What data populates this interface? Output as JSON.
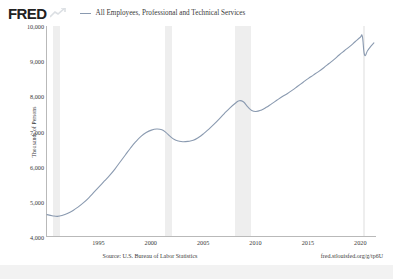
{
  "brand": {
    "logo_text": "FRED",
    "logo_mark_icon": "fred-trend-arrow-icon"
  },
  "legend": {
    "swatch_icon": "line-swatch-icon",
    "label": "All Employees, Professional and Technical Services"
  },
  "footer": {
    "source": "Source: U.S. Bureau of Labor Statistics",
    "permalink": "fred.stlouisfed.org/g/tp6U"
  },
  "colors": {
    "series_line": "#8a9ab0",
    "recession_band": "#eeeeee",
    "axis": "#b9b9b9",
    "text": "#3a3a3a",
    "background": "#ffffff"
  },
  "chart_data": {
    "type": "line",
    "title": "All Employees, Professional and Technical Services",
    "xlabel": "",
    "ylabel": "Thousands of Persons",
    "xlim": [
      1990,
      2021.5
    ],
    "ylim": [
      4000,
      10000
    ],
    "ytick_labels": [
      "10,000",
      "9,000",
      "8,000",
      "7,000",
      "6,000",
      "5,000",
      "4,000"
    ],
    "ytick_values": [
      10000,
      9000,
      8000,
      7000,
      6000,
      5000,
      4000
    ],
    "xtick_labels": [
      "1995",
      "2000",
      "2005",
      "2010",
      "2015",
      "2020"
    ],
    "xtick_values": [
      1995,
      2000,
      2005,
      2010,
      2015,
      2020
    ],
    "grid": false,
    "legend_position": "top",
    "units": "Thousands of Persons",
    "frequency": "Monthly, Seasonally Adjusted",
    "recession_bands": [
      {
        "start": 1990.58,
        "end": 1991.25
      },
      {
        "start": 2001.25,
        "end": 2001.92
      },
      {
        "start": 2007.96,
        "end": 2009.5
      },
      {
        "start": 2020.17,
        "end": 2020.33
      }
    ],
    "series": [
      {
        "name": "All Employees, Professional and Technical Services",
        "color": "#8a9ab0",
        "x": [
          1990.0,
          1990.5,
          1991.0,
          1991.5,
          1992.0,
          1992.5,
          1993.0,
          1993.5,
          1994.0,
          1994.5,
          1995.0,
          1995.5,
          1996.0,
          1996.5,
          1997.0,
          1997.5,
          1998.0,
          1998.5,
          1999.0,
          1999.5,
          2000.0,
          2000.5,
          2001.0,
          2001.4,
          2001.8,
          2002.2,
          2002.6,
          2003.0,
          2003.5,
          2004.0,
          2004.5,
          2005.0,
          2005.5,
          2006.0,
          2006.5,
          2007.0,
          2007.5,
          2008.0,
          2008.4,
          2008.8,
          2009.2,
          2009.6,
          2010.0,
          2010.5,
          2011.0,
          2011.5,
          2012.0,
          2012.5,
          2013.0,
          2013.5,
          2014.0,
          2014.5,
          2015.0,
          2015.5,
          2016.0,
          2016.5,
          2017.0,
          2017.5,
          2018.0,
          2018.5,
          2019.0,
          2019.5,
          2020.0,
          2020.2,
          2020.4,
          2020.7,
          2021.0,
          2021.3
        ],
        "y": [
          4620,
          4590,
          4570,
          4600,
          4660,
          4740,
          4840,
          4960,
          5100,
          5260,
          5420,
          5580,
          5740,
          5920,
          6120,
          6320,
          6520,
          6700,
          6850,
          6960,
          7030,
          7060,
          7040,
          6960,
          6850,
          6760,
          6720,
          6700,
          6710,
          6740,
          6820,
          6930,
          7060,
          7200,
          7350,
          7510,
          7660,
          7790,
          7870,
          7840,
          7700,
          7590,
          7560,
          7600,
          7680,
          7780,
          7880,
          7980,
          8070,
          8170,
          8280,
          8390,
          8500,
          8600,
          8700,
          8810,
          8930,
          9050,
          9180,
          9300,
          9420,
          9550,
          9680,
          9700,
          9180,
          9300,
          9420,
          9520
        ]
      }
    ]
  }
}
